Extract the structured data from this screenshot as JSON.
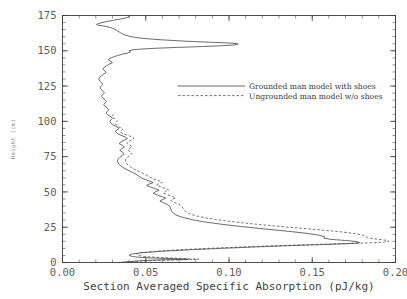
{
  "chart_data": {
    "type": "line",
    "title": "",
    "xlabel": "Section Averaged Specific Absorption (pJ/kg)",
    "ylabel": "Height (cm)",
    "xlim": [
      0.0,
      0.2
    ],
    "ylim": [
      0,
      175
    ],
    "xticks": [
      0.0,
      0.05,
      0.1,
      0.15,
      0.2
    ],
    "xticklabels": [
      "0.00",
      "0.05",
      "0.10",
      "0.15",
      "0.20"
    ],
    "yticks": [
      0,
      25,
      50,
      75,
      100,
      125,
      150,
      175
    ],
    "yticklabels": [
      "0",
      "25",
      "50",
      "75",
      "100",
      "125",
      "150",
      "175"
    ],
    "x_minor_step": 0.01,
    "y_minor_step": 5,
    "grid": false,
    "frame": true,
    "tick_direction": "in",
    "legend_position": "center-right-upper",
    "series": [
      {
        "name": "Grounded man model with shoes",
        "style": "solid",
        "color": "#39393b",
        "orientation": "x=absorption, y=height",
        "points": [
          [
            0.0355,
            0.0
          ],
          [
            0.04,
            0.6
          ],
          [
            0.046,
            1.2
          ],
          [
            0.052,
            1.6
          ],
          [
            0.06,
            1.9
          ],
          [
            0.068,
            2.1
          ],
          [
            0.0755,
            2.3
          ],
          [
            0.07,
            2.6
          ],
          [
            0.062,
            2.9
          ],
          [
            0.054,
            3.2
          ],
          [
            0.047,
            3.6
          ],
          [
            0.042,
            4.2
          ],
          [
            0.04,
            5.0
          ],
          [
            0.0415,
            6.0
          ],
          [
            0.048,
            7.0
          ],
          [
            0.06,
            8.0
          ],
          [
            0.076,
            9.0
          ],
          [
            0.095,
            10.0
          ],
          [
            0.115,
            11.0
          ],
          [
            0.138,
            12.0
          ],
          [
            0.158,
            12.8
          ],
          [
            0.172,
            13.4
          ],
          [
            0.1785,
            14.0
          ],
          [
            0.177,
            14.8
          ],
          [
            0.17,
            15.6
          ],
          [
            0.161,
            16.4
          ],
          [
            0.157,
            17.2
          ],
          [
            0.1575,
            18.2
          ],
          [
            0.154,
            19.4
          ],
          [
            0.147,
            20.6
          ],
          [
            0.138,
            21.8
          ],
          [
            0.128,
            23.0
          ],
          [
            0.118,
            24.2
          ],
          [
            0.108,
            25.4
          ],
          [
            0.099,
            26.6
          ],
          [
            0.091,
            27.8
          ],
          [
            0.084,
            29.0
          ],
          [
            0.0785,
            30.2
          ],
          [
            0.074,
            31.4
          ],
          [
            0.0705,
            32.6
          ],
          [
            0.068,
            33.8
          ],
          [
            0.0665,
            35.0
          ],
          [
            0.0655,
            36.4
          ],
          [
            0.065,
            38.0
          ],
          [
            0.0645,
            39.6
          ],
          [
            0.063,
            41.0
          ],
          [
            0.0605,
            42.4
          ],
          [
            0.0585,
            43.6
          ],
          [
            0.06,
            44.6
          ],
          [
            0.062,
            45.6
          ],
          [
            0.06,
            46.6
          ],
          [
            0.057,
            47.8
          ],
          [
            0.0545,
            49.0
          ],
          [
            0.056,
            50.2
          ],
          [
            0.058,
            51.2
          ],
          [
            0.056,
            52.2
          ],
          [
            0.053,
            53.4
          ],
          [
            0.0505,
            54.6
          ],
          [
            0.052,
            55.6
          ],
          [
            0.0545,
            56.6
          ],
          [
            0.052,
            57.8
          ],
          [
            0.049,
            59.0
          ],
          [
            0.047,
            60.2
          ],
          [
            0.0455,
            61.4
          ],
          [
            0.044,
            62.6
          ],
          [
            0.042,
            63.8
          ],
          [
            0.04,
            65.0
          ],
          [
            0.038,
            66.2
          ],
          [
            0.0362,
            67.4
          ],
          [
            0.0348,
            68.6
          ],
          [
            0.0338,
            69.8
          ],
          [
            0.0332,
            71.0
          ],
          [
            0.033,
            72.2
          ],
          [
            0.0335,
            73.4
          ],
          [
            0.0345,
            74.6
          ],
          [
            0.0358,
            75.8
          ],
          [
            0.037,
            77.0
          ],
          [
            0.036,
            78.2
          ],
          [
            0.0345,
            79.4
          ],
          [
            0.0355,
            80.6
          ],
          [
            0.0372,
            81.8
          ],
          [
            0.036,
            83.0
          ],
          [
            0.034,
            84.2
          ],
          [
            0.0352,
            85.4
          ],
          [
            0.037,
            86.6
          ],
          [
            0.039,
            87.8
          ],
          [
            0.0375,
            89.0
          ],
          [
            0.035,
            90.2
          ],
          [
            0.033,
            91.4
          ],
          [
            0.0318,
            92.6
          ],
          [
            0.0325,
            93.8
          ],
          [
            0.034,
            95.0
          ],
          [
            0.0325,
            96.2
          ],
          [
            0.0305,
            97.4
          ],
          [
            0.0292,
            98.6
          ],
          [
            0.0285,
            99.8
          ],
          [
            0.029,
            101.0
          ],
          [
            0.03,
            102.2
          ],
          [
            0.0288,
            103.4
          ],
          [
            0.0272,
            104.6
          ],
          [
            0.0262,
            105.8
          ],
          [
            0.0268,
            107.0
          ],
          [
            0.0278,
            108.2
          ],
          [
            0.0268,
            109.4
          ],
          [
            0.0255,
            110.6
          ],
          [
            0.0248,
            111.8
          ],
          [
            0.0255,
            113.0
          ],
          [
            0.0265,
            114.2
          ],
          [
            0.0255,
            115.4
          ],
          [
            0.0242,
            116.6
          ],
          [
            0.0235,
            117.8
          ],
          [
            0.0242,
            119.0
          ],
          [
            0.0252,
            120.2
          ],
          [
            0.0243,
            121.4
          ],
          [
            0.0232,
            122.6
          ],
          [
            0.0226,
            123.8
          ],
          [
            0.0232,
            125.0
          ],
          [
            0.0242,
            126.2
          ],
          [
            0.0235,
            127.4
          ],
          [
            0.0224,
            128.6
          ],
          [
            0.0218,
            129.8
          ],
          [
            0.0222,
            131.0
          ],
          [
            0.0232,
            132.2
          ],
          [
            0.0246,
            133.4
          ],
          [
            0.0262,
            134.6
          ],
          [
            0.0255,
            135.8
          ],
          [
            0.0242,
            137.0
          ],
          [
            0.025,
            138.2
          ],
          [
            0.0265,
            139.4
          ],
          [
            0.0282,
            140.6
          ],
          [
            0.03,
            141.6
          ],
          [
            0.029,
            142.6
          ],
          [
            0.0275,
            143.6
          ],
          [
            0.0285,
            144.6
          ],
          [
            0.0305,
            145.6
          ],
          [
            0.033,
            146.6
          ],
          [
            0.036,
            147.6
          ],
          [
            0.039,
            148.4
          ],
          [
            0.0408,
            149.2
          ],
          [
            0.04,
            150.0
          ],
          [
            0.042,
            150.6
          ],
          [
            0.047,
            151.2
          ],
          [
            0.056,
            151.8
          ],
          [
            0.069,
            152.4
          ],
          [
            0.084,
            153.0
          ],
          [
            0.096,
            153.6
          ],
          [
            0.1035,
            154.2
          ],
          [
            0.1055,
            154.8
          ],
          [
            0.102,
            155.4
          ],
          [
            0.09,
            156.0
          ],
          [
            0.074,
            156.8
          ],
          [
            0.059,
            157.8
          ],
          [
            0.048,
            158.8
          ],
          [
            0.041,
            160.0
          ],
          [
            0.037,
            161.4
          ],
          [
            0.0348,
            162.8
          ],
          [
            0.033,
            164.2
          ],
          [
            0.0312,
            165.4
          ],
          [
            0.029,
            166.4
          ],
          [
            0.0262,
            167.2
          ],
          [
            0.0232,
            167.8
          ],
          [
            0.021,
            168.2
          ],
          [
            0.0205,
            168.8
          ],
          [
            0.0225,
            169.6
          ],
          [
            0.0262,
            170.6
          ],
          [
            0.0305,
            171.6
          ],
          [
            0.0345,
            172.4
          ],
          [
            0.0378,
            173.2
          ],
          [
            0.0398,
            173.9
          ],
          [
            0.0402,
            174.5
          ],
          [
            0.0392,
            175.0
          ]
        ]
      },
      {
        "name": "Ungrounded man model w/o shoes",
        "style": "dashed",
        "color": "#4a4a4c",
        "orientation": "x=absorption, y=height",
        "points": [
          [
            0.033,
            0.0
          ],
          [
            0.039,
            0.5
          ],
          [
            0.047,
            1.0
          ],
          [
            0.056,
            1.4
          ],
          [
            0.065,
            1.7
          ],
          [
            0.074,
            2.0
          ],
          [
            0.082,
            2.3
          ],
          [
            0.076,
            2.7
          ],
          [
            0.067,
            3.1
          ],
          [
            0.058,
            3.6
          ],
          [
            0.05,
            4.2
          ],
          [
            0.0455,
            5.0
          ],
          [
            0.0445,
            6.0
          ],
          [
            0.048,
            7.0
          ],
          [
            0.057,
            8.0
          ],
          [
            0.07,
            9.0
          ],
          [
            0.087,
            10.0
          ],
          [
            0.108,
            11.0
          ],
          [
            0.13,
            12.0
          ],
          [
            0.152,
            12.8
          ],
          [
            0.172,
            13.4
          ],
          [
            0.187,
            14.0
          ],
          [
            0.1945,
            14.6
          ],
          [
            0.196,
            15.2
          ],
          [
            0.193,
            16.0
          ],
          [
            0.187,
            16.8
          ],
          [
            0.183,
            17.6
          ],
          [
            0.182,
            18.6
          ],
          [
            0.18,
            19.6
          ],
          [
            0.174,
            20.8
          ],
          [
            0.165,
            22.0
          ],
          [
            0.154,
            23.2
          ],
          [
            0.142,
            24.4
          ],
          [
            0.13,
            25.6
          ],
          [
            0.119,
            26.8
          ],
          [
            0.109,
            28.0
          ],
          [
            0.1,
            29.2
          ],
          [
            0.0925,
            30.4
          ],
          [
            0.0862,
            31.6
          ],
          [
            0.0812,
            32.8
          ],
          [
            0.0775,
            34.0
          ],
          [
            0.075,
            35.2
          ],
          [
            0.0735,
            36.6
          ],
          [
            0.0725,
            38.2
          ],
          [
            0.0715,
            39.8
          ],
          [
            0.0698,
            41.2
          ],
          [
            0.0672,
            42.6
          ],
          [
            0.065,
            43.8
          ],
          [
            0.0662,
            44.8
          ],
          [
            0.068,
            45.8
          ],
          [
            0.0662,
            46.8
          ],
          [
            0.0632,
            48.0
          ],
          [
            0.0605,
            49.2
          ],
          [
            0.0618,
            50.4
          ],
          [
            0.0638,
            51.4
          ],
          [
            0.062,
            52.4
          ],
          [
            0.059,
            53.6
          ],
          [
            0.0565,
            54.8
          ],
          [
            0.0578,
            55.8
          ],
          [
            0.06,
            56.8
          ],
          [
            0.0578,
            58.0
          ],
          [
            0.0548,
            59.2
          ],
          [
            0.0525,
            60.4
          ],
          [
            0.0508,
            61.6
          ],
          [
            0.049,
            62.8
          ],
          [
            0.0468,
            64.0
          ],
          [
            0.0448,
            65.2
          ],
          [
            0.0428,
            66.4
          ],
          [
            0.041,
            67.6
          ],
          [
            0.0396,
            68.8
          ],
          [
            0.0386,
            70.0
          ],
          [
            0.038,
            71.2
          ],
          [
            0.0378,
            72.4
          ],
          [
            0.0382,
            73.6
          ],
          [
            0.0392,
            74.8
          ],
          [
            0.0405,
            76.0
          ],
          [
            0.0418,
            77.2
          ],
          [
            0.0408,
            78.4
          ],
          [
            0.0392,
            79.6
          ],
          [
            0.0402,
            80.8
          ],
          [
            0.0418,
            82.0
          ],
          [
            0.0405,
            83.2
          ],
          [
            0.0386,
            84.4
          ],
          [
            0.0396,
            85.6
          ],
          [
            0.0414,
            86.8
          ],
          [
            0.043,
            88.0
          ],
          [
            0.0412,
            89.2
          ],
          [
            0.0386,
            90.4
          ],
          [
            0.0362,
            91.4
          ],
          [
            0.0348,
            92.4
          ],
          [
            0.0352,
            93.4
          ],
          [
            0.0362,
            94.4
          ],
          [
            0.035,
            95.4
          ],
          [
            0.0334,
            96.4
          ],
          [
            0.0322,
            97.4
          ],
          [
            0.0318,
            98.4
          ],
          [
            0.0322,
            99.4
          ],
          [
            0.033,
            100.4
          ],
          [
            0.032,
            101.4
          ],
          [
            0.0306,
            102.4
          ],
          [
            0.0296,
            103.4
          ],
          [
            0.03,
            104.4
          ],
          [
            0.0308,
            105.4
          ]
        ]
      }
    ],
    "annotations": []
  },
  "legend": {
    "entries": [
      {
        "label": "Grounded man model with shoes",
        "style": "solid"
      },
      {
        "label": "Ungrounded man model w/o shoes",
        "style": "dashed"
      }
    ]
  },
  "axes": {
    "x_title": "Section Averaged Specific Absorption (pJ/kg)",
    "y_title": "Height (cm)"
  }
}
